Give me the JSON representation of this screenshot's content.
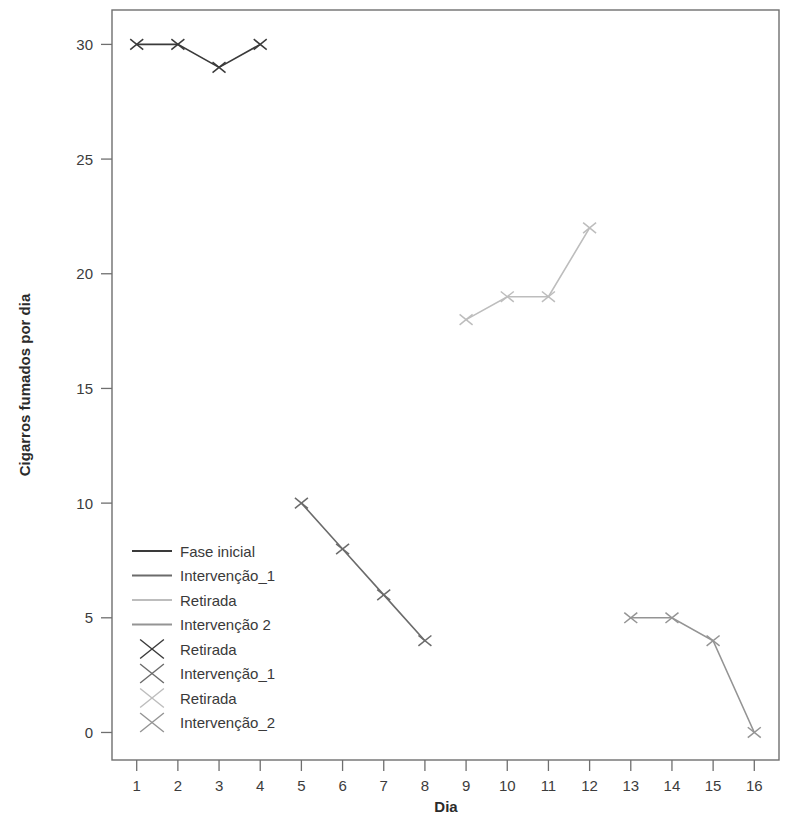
{
  "chart_data": {
    "type": "line",
    "title": "",
    "xlabel": "Dia",
    "ylabel": "Cigarros fumados por dia",
    "xlim": [
      0.4,
      16.6
    ],
    "ylim": [
      -1.2,
      31.5
    ],
    "xticks": [
      "1",
      "2",
      "3",
      "4",
      "5",
      "6",
      "7",
      "8",
      "9",
      "10",
      "11",
      "12",
      "13",
      "14",
      "15",
      "16"
    ],
    "yticks": [
      "0",
      "5",
      "10",
      "15",
      "20",
      "25",
      "30"
    ],
    "grid": false,
    "legend_position": "inside-lower-left",
    "marker": "x",
    "series": [
      {
        "name": "Fase inicial",
        "color": "#3a3a3a",
        "x": [
          1,
          2,
          3,
          4
        ],
        "values": [
          30,
          30,
          29,
          30
        ]
      },
      {
        "name": "Intervenção_1",
        "color": "#6b6b6b",
        "x": [
          5,
          6,
          7,
          8
        ],
        "values": [
          10,
          8,
          6,
          4
        ]
      },
      {
        "name": "Retirada",
        "color": "#bdbdbd",
        "x": [
          9,
          10,
          11,
          12
        ],
        "values": [
          18,
          19,
          19,
          22
        ]
      },
      {
        "name": "Intervenção 2",
        "color": "#949494",
        "x": [
          13,
          14,
          15,
          16
        ],
        "values": [
          5,
          5,
          4,
          0
        ]
      }
    ],
    "legend_entries": [
      {
        "label": "Fase inicial",
        "type": "line",
        "color": "#3a3a3a"
      },
      {
        "label": "Intervenção_1",
        "type": "line",
        "color": "#6b6b6b"
      },
      {
        "label": "Retirada",
        "type": "line",
        "color": "#bdbdbd"
      },
      {
        "label": "Intervenção 2",
        "type": "line",
        "color": "#949494"
      },
      {
        "label": "Retirada",
        "type": "marker",
        "color": "#3a3a3a"
      },
      {
        "label": "Intervenção_1",
        "type": "marker",
        "color": "#6b6b6b"
      },
      {
        "label": "Retirada",
        "type": "marker",
        "color": "#bdbdbd"
      },
      {
        "label": "Intervenção_2",
        "type": "marker",
        "color": "#949494"
      }
    ]
  }
}
